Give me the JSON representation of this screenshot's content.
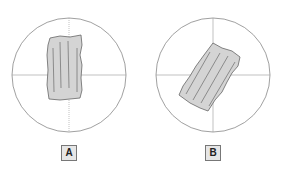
{
  "panels": [
    {
      "label": "A",
      "description": "field of view with specimen fragment aligned vertically"
    },
    {
      "label": "B",
      "description": "field of view with specimen fragment rotated diagonally"
    }
  ],
  "colors": {
    "circle": "#888888",
    "specimen_fill": "#d4d4d4",
    "specimen_stroke": "#666666",
    "label_bg": "#e6e6e6"
  }
}
